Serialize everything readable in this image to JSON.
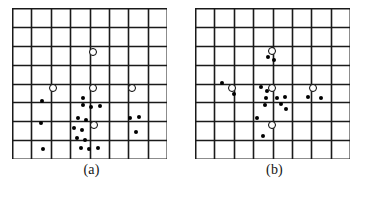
{
  "figure": {
    "background_color": "#ffffff",
    "grid": {
      "columns": 8,
      "rows": 8,
      "cell_width": 19.4,
      "cell_height": 18.9,
      "line_color": "#1a1a1a",
      "line_width": 1.6,
      "border_width": 2.0,
      "origin_x": 12,
      "origin_y": 8,
      "width": 155,
      "height": 151
    },
    "legend_semantics": {
      "filled_dot": "data point",
      "open_circle": "node marker"
    },
    "marker_colors": {
      "dot_fill": "#000000",
      "ring_stroke": "#000000",
      "ring_fill": "#ffffff"
    }
  },
  "panels": [
    {
      "id": "a",
      "label": "(a)",
      "rings": [
        {
          "x": 80.5,
          "y": 44.0
        },
        {
          "x": 40.5,
          "y": 80.0
        },
        {
          "x": 80.5,
          "y": 80.0
        },
        {
          "x": 119.5,
          "y": 80.0
        },
        {
          "x": 81.5,
          "y": 117.0
        }
      ],
      "dots": [
        {
          "x": 30.0,
          "y": 93.0
        },
        {
          "x": 29.0,
          "y": 115.0
        },
        {
          "x": 31.0,
          "y": 141.0
        },
        {
          "x": 71.0,
          "y": 90.0
        },
        {
          "x": 71.0,
          "y": 97.0
        },
        {
          "x": 79.0,
          "y": 99.0
        },
        {
          "x": 88.0,
          "y": 98.0
        },
        {
          "x": 66.0,
          "y": 110.0
        },
        {
          "x": 74.0,
          "y": 112.0
        },
        {
          "x": 62.0,
          "y": 120.0
        },
        {
          "x": 70.0,
          "y": 122.0
        },
        {
          "x": 65.0,
          "y": 130.0
        },
        {
          "x": 73.0,
          "y": 132.0
        },
        {
          "x": 69.0,
          "y": 140.0
        },
        {
          "x": 77.0,
          "y": 141.0
        },
        {
          "x": 86.0,
          "y": 140.0
        },
        {
          "x": 118.0,
          "y": 110.0
        },
        {
          "x": 127.0,
          "y": 109.0
        },
        {
          "x": 124.0,
          "y": 124.0
        }
      ]
    },
    {
      "id": "b",
      "label": "(b)",
      "rings": [
        {
          "x": 77.0,
          "y": 43.0
        },
        {
          "x": 36.5,
          "y": 80.0
        },
        {
          "x": 77.0,
          "y": 80.0
        },
        {
          "x": 118.0,
          "y": 80.0
        },
        {
          "x": 77.0,
          "y": 117.0
        }
      ],
      "dots": [
        {
          "x": 73.0,
          "y": 49.0
        },
        {
          "x": 79.0,
          "y": 52.0
        },
        {
          "x": 27.0,
          "y": 75.0
        },
        {
          "x": 39.0,
          "y": 86.0
        },
        {
          "x": 66.0,
          "y": 79.0
        },
        {
          "x": 72.0,
          "y": 83.0
        },
        {
          "x": 71.0,
          "y": 90.0
        },
        {
          "x": 70.0,
          "y": 97.0
        },
        {
          "x": 82.0,
          "y": 90.0
        },
        {
          "x": 90.0,
          "y": 89.0
        },
        {
          "x": 86.0,
          "y": 96.0
        },
        {
          "x": 91.0,
          "y": 101.0
        },
        {
          "x": 113.0,
          "y": 89.0
        },
        {
          "x": 126.0,
          "y": 90.0
        },
        {
          "x": 62.0,
          "y": 110.0
        },
        {
          "x": 68.0,
          "y": 128.0
        }
      ]
    }
  ]
}
